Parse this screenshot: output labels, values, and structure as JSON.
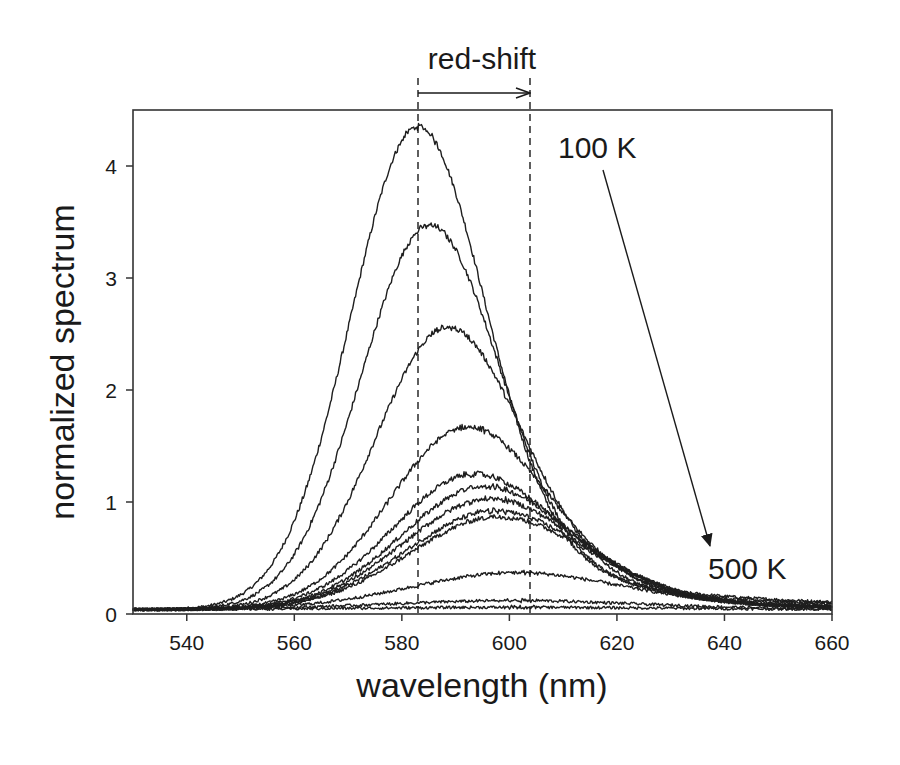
{
  "chart_data": {
    "type": "line",
    "title": "",
    "xlabel": "wavelength (nm)",
    "ylabel": "normalized spectrum",
    "xlim": [
      530,
      660
    ],
    "ylim": [
      0,
      4.5
    ],
    "xticks": [
      540,
      560,
      580,
      600,
      620,
      640,
      660
    ],
    "yticks": [
      0,
      1,
      2,
      3,
      4
    ],
    "grid": false,
    "legend": null,
    "baseline": 0.04,
    "series_model": "asymmetric peak: gaussian left side; right side 0.75*gaussian + 0.25*lorentzian(gamma=20)",
    "series": [
      {
        "name": "100 K",
        "peak_nm": 583.0,
        "peak_value": 4.31,
        "sigma_left": 12.5,
        "sigma_right": 12.5
      },
      {
        "name": "curve 2",
        "peak_nm": 585.2,
        "peak_value": 3.43,
        "sigma_left": 12.8,
        "sigma_right": 13.0
      },
      {
        "name": "curve 3",
        "peak_nm": 588.6,
        "peak_value": 2.52,
        "sigma_left": 13.5,
        "sigma_right": 14.0
      },
      {
        "name": "curve 4",
        "peak_nm": 592.3,
        "peak_value": 1.63,
        "sigma_left": 14.5,
        "sigma_right": 15.5
      },
      {
        "name": "curve 5",
        "peak_nm": 593.5,
        "peak_value": 1.21,
        "sigma_left": 15.0,
        "sigma_right": 17.0
      },
      {
        "name": "curve 6",
        "peak_nm": 595.5,
        "peak_value": 1.1,
        "sigma_left": 15.5,
        "sigma_right": 17.0
      },
      {
        "name": "curve 7",
        "peak_nm": 596.5,
        "peak_value": 0.99,
        "sigma_left": 16.0,
        "sigma_right": 17.5
      },
      {
        "name": "curve 8",
        "peak_nm": 597.5,
        "peak_value": 0.88,
        "sigma_left": 16.5,
        "sigma_right": 18.0
      },
      {
        "name": "curve 9",
        "peak_nm": 598.0,
        "peak_value": 0.83,
        "sigma_left": 16.5,
        "sigma_right": 18.0
      },
      {
        "name": "curve 10",
        "peak_nm": 601.6,
        "peak_value": 0.33,
        "sigma_left": 20.0,
        "sigma_right": 22.0
      },
      {
        "name": "curve 11",
        "peak_nm": 602.0,
        "peak_value": 0.08,
        "sigma_left": 25.0,
        "sigma_right": 25.0
      },
      {
        "name": "500 K",
        "peak_nm": 603.0,
        "peak_value": 0.02,
        "sigma_left": 30.0,
        "sigma_right": 30.0
      }
    ],
    "annotations": [
      {
        "type": "text",
        "text": "red-shift",
        "x_nm": 593.4,
        "y_px": 68
      },
      {
        "type": "dashed_vline",
        "x_nm": 583.0
      },
      {
        "type": "dashed_vline",
        "x_nm": 603.8
      },
      {
        "type": "arrow",
        "from_nm": 583.0,
        "to_nm": 603.8,
        "label": "red-shift"
      },
      {
        "type": "text",
        "text": "100 K"
      },
      {
        "type": "text",
        "text": "500 K"
      },
      {
        "type": "arrow",
        "from": "100 K",
        "to": "500 K"
      }
    ]
  },
  "labels": {
    "xlabel": "wavelength (nm)",
    "ylabel": "normalized spectrum",
    "redshift": "red-shift",
    "temp_start": "100 K",
    "temp_end": "500 K"
  },
  "ticks": {
    "x": [
      "540",
      "560",
      "580",
      "600",
      "620",
      "640",
      "660"
    ],
    "y": [
      "0",
      "1",
      "2",
      "3",
      "4"
    ]
  }
}
